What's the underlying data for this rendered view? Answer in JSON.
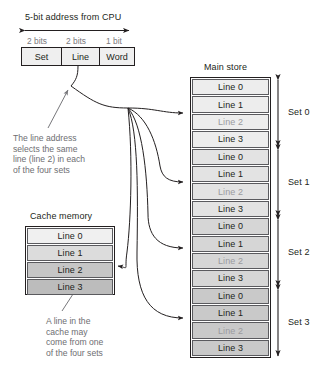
{
  "address": {
    "header": "5-bit address from CPU",
    "bit_labels": [
      "2 bits",
      "2 bits",
      "1 bit"
    ],
    "fields": [
      "Set",
      "Line",
      "Word"
    ]
  },
  "cache": {
    "title": "Cache memory",
    "rows": [
      {
        "label": "Line 0",
        "shade": "#f0f0f0",
        "dim": false
      },
      {
        "label": "Line 1",
        "shade": "#dcdcdc",
        "dim": false
      },
      {
        "label": "Line 2",
        "shade": "#c6c6c6",
        "dim": false
      },
      {
        "label": "Line 3",
        "shade": "#bcbcbc",
        "dim": false
      }
    ]
  },
  "main_store": {
    "title": "Main store",
    "rows": [
      {
        "label": "Line 0",
        "shade": "#ededed",
        "dim": false
      },
      {
        "label": "Line 1",
        "shade": "#ededed",
        "dim": false
      },
      {
        "label": "Line 2",
        "shade": "#ededed",
        "dim": true
      },
      {
        "label": "Line 3",
        "shade": "#ededed",
        "dim": false
      },
      {
        "label": "Line 0",
        "shade": "#e3e3e3",
        "dim": false
      },
      {
        "label": "Line 1",
        "shade": "#e3e3e3",
        "dim": false
      },
      {
        "label": "Line 2",
        "shade": "#e3e3e3",
        "dim": true
      },
      {
        "label": "Line 3",
        "shade": "#e3e3e3",
        "dim": false
      },
      {
        "label": "Line 0",
        "shade": "#d6d6d6",
        "dim": false
      },
      {
        "label": "Line 1",
        "shade": "#d6d6d6",
        "dim": false
      },
      {
        "label": "Line 2",
        "shade": "#d6d6d6",
        "dim": true
      },
      {
        "label": "Line 3",
        "shade": "#d6d6d6",
        "dim": false
      },
      {
        "label": "Line 0",
        "shade": "#c9c9c9",
        "dim": false
      },
      {
        "label": "Line 1",
        "shade": "#c9c9c9",
        "dim": false
      },
      {
        "label": "Line 2",
        "shade": "#c9c9c9",
        "dim": true
      },
      {
        "label": "Line 3",
        "shade": "#c9c9c9",
        "dim": false
      }
    ],
    "set_labels": [
      "Set 0",
      "Set 1",
      "Set 2",
      "Set 3"
    ]
  },
  "annotations": {
    "line_select": [
      "The line address",
      "selects the same",
      "line (line 2) in each",
      "of the four sets"
    ],
    "cache_source": [
      "A line in the",
      "cache may",
      "come from one",
      "of the four sets"
    ]
  },
  "colors": {
    "ink": "#231f20",
    "caption": "#6e6e72",
    "dim_text": "#9b9b9f",
    "row_border": "#5a5a5e",
    "field_fill": "#efefef"
  }
}
